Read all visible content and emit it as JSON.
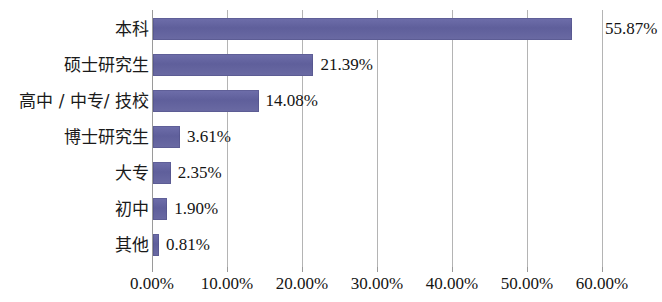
{
  "chart_data": {
    "type": "bar",
    "orientation": "horizontal",
    "title": "",
    "subtitle": "",
    "xlabel": "",
    "ylabel": "",
    "categories": [
      "本科",
      "硕士研究生",
      "高中 / 中专/ 技校",
      "博士研究生",
      "大专",
      "初中",
      "其他"
    ],
    "values": [
      55.87,
      21.39,
      14.08,
      3.61,
      2.35,
      1.9,
      0.81
    ],
    "value_labels": [
      "55.87%",
      "21.39%",
      "14.08%",
      "3.61%",
      "2.35%",
      "1.90%",
      "0.81%"
    ],
    "xlim": [
      0,
      60
    ],
    "xticks": [
      0,
      10,
      20,
      30,
      40,
      50,
      60
    ],
    "xtick_labels": [
      "0.00%",
      "10.00%",
      "20.00%",
      "30.00%",
      "40.00%",
      "50.00%",
      "60.00%"
    ],
    "grid": true,
    "grid_axis": "x",
    "legend": false,
    "legend_position": "none",
    "bar_color": "#63639f",
    "gridline_color": "#b4b4b4",
    "axis_color": "#9a9a9a",
    "text_color": "#141414",
    "background_color": "#ffffff"
  }
}
